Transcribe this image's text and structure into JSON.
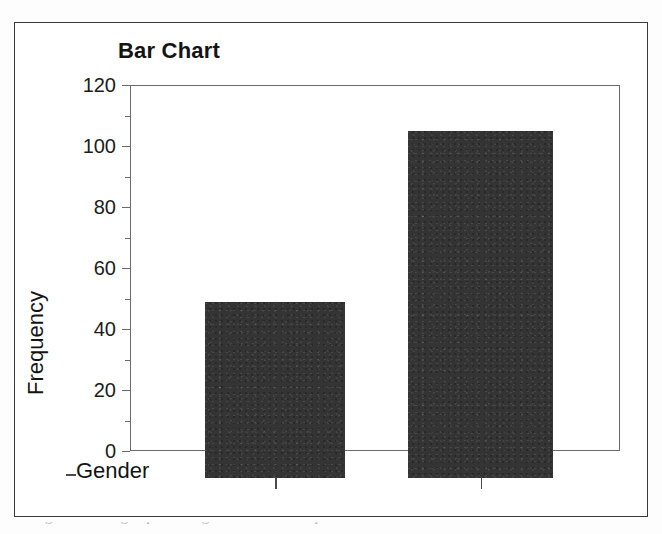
{
  "figure": {
    "title": "Bar Chart",
    "y_axis_title": "Frequency",
    "x_axis_title": "Gender",
    "caption_partial": "Figure  Bar graph for gender in sample"
  },
  "chart_data": {
    "type": "bar",
    "title": "Bar Chart",
    "xlabel": "Gender",
    "ylabel": "Frequency",
    "categories": [
      "",
      ""
    ],
    "values": [
      49,
      105
    ],
    "ylim": [
      0,
      120
    ],
    "y_ticks": [
      0,
      20,
      40,
      60,
      80,
      100,
      120
    ],
    "y_tick_labels": [
      "0",
      "20",
      "40",
      "60",
      "80",
      "100",
      "120"
    ],
    "y_minor_ticks": [
      10,
      30,
      50,
      70,
      90,
      110
    ],
    "grid": false,
    "legend": "none",
    "bar_color": "#343434",
    "axis_color": "#6a6a6a"
  },
  "colors": {
    "bar": "#343434",
    "axis": "#6a6a6a",
    "frame": "#3a3a3a",
    "text": "#141414",
    "background": "#ffffff"
  }
}
